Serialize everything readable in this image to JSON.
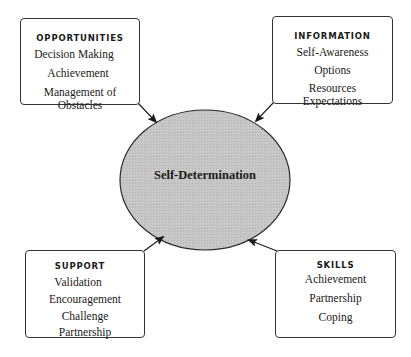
{
  "diagram": {
    "center": {
      "label": "Self-Determination",
      "fill": "#c4c4c4",
      "stroke": "#2a2a2a"
    },
    "nodes": [
      {
        "id": "opportunities",
        "title": "OPPORTUNITIES",
        "items": [
          "Decision Making",
          "Achievement",
          "Management of Obstacles"
        ],
        "position": "top-left"
      },
      {
        "id": "information",
        "title": "INFORMATION",
        "items": [
          "Self-Awareness",
          "Options",
          "Resources",
          "Expectations"
        ],
        "position": "top-right"
      },
      {
        "id": "support",
        "title": "SUPPORT",
        "items": [
          "Validation",
          "Encouragement",
          "Challenge",
          "Partnership"
        ],
        "position": "bottom-left"
      },
      {
        "id": "skills",
        "title": "SKILLS",
        "items": [
          "Achievement",
          "Partnership",
          "Coping"
        ],
        "position": "bottom-right"
      }
    ],
    "edges": [
      {
        "from": "opportunities",
        "to": "center"
      },
      {
        "from": "information",
        "to": "center"
      },
      {
        "from": "support",
        "to": "center"
      },
      {
        "from": "skills",
        "to": "center"
      }
    ]
  }
}
